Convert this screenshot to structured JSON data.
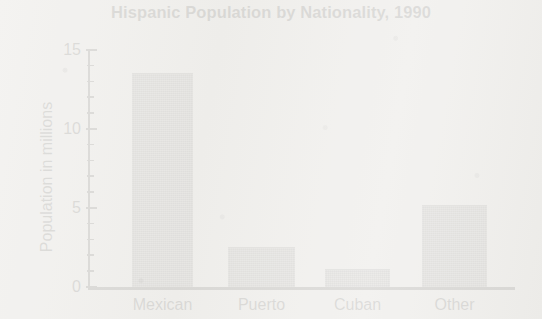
{
  "chart_data": {
    "type": "bar",
    "title": "Hispanic Population by Nationality, 1990",
    "xlabel": "",
    "ylabel": "Population in millions",
    "categories": [
      "Mexican",
      "Puerto",
      "Cuban",
      "Other"
    ],
    "values": [
      13.5,
      2.5,
      1.1,
      5.1
    ],
    "ylim": [
      0,
      15
    ],
    "yticks": [
      0,
      5,
      10,
      15
    ],
    "ytick_labels": [
      "0",
      "5",
      "10",
      "15"
    ],
    "yminor_tick_interval": 1,
    "grid": false,
    "legend": null,
    "bar_color": "#7e7e7e",
    "axis_color": "#1d1d1d",
    "background_color": "#f2f1ef"
  },
  "axis": {
    "y_labels": [
      {
        "value": 15,
        "text": "15"
      },
      {
        "value": 10,
        "text": "10"
      },
      {
        "value": 5,
        "text": "5"
      },
      {
        "value": 0,
        "text": "0"
      }
    ]
  },
  "bars": [
    {
      "label": "Mexican",
      "value": 13.5
    },
    {
      "label": "Puerto",
      "value": 2.5
    },
    {
      "label": "Cuban",
      "value": 1.1
    },
    {
      "label": "Other",
      "value": 5.1
    }
  ]
}
